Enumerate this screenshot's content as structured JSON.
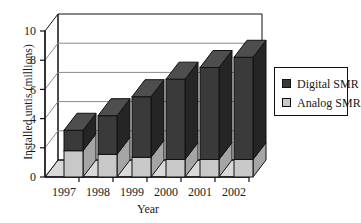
{
  "chart_data": {
    "type": "bar",
    "subtype": "stacked-column-3d",
    "title": "",
    "xlabel": "Year",
    "ylabel": "Installed untis (millions)",
    "categories": [
      "1997",
      "1998",
      "1999",
      "2000",
      "2001",
      "2002"
    ],
    "series": [
      {
        "name": "Analog SMR",
        "color": "#c8c8c8",
        "values": [
          1.8,
          1.55,
          1.35,
          1.2,
          1.2,
          1.2
        ]
      },
      {
        "name": "Digital SMR",
        "color": "#3a3a3a",
        "values": [
          1.4,
          2.65,
          4.15,
          5.5,
          6.3,
          7.0
        ]
      }
    ],
    "totals": [
      3.2,
      4.2,
      5.5,
      6.7,
      7.5,
      8.2
    ],
    "ylim": [
      0,
      10
    ],
    "yticks": [
      0,
      2,
      4,
      6,
      8,
      10
    ],
    "ytick_labels": [
      "0",
      "2",
      "4",
      "6",
      "8",
      "10"
    ],
    "grid": true,
    "grid_axis": "y",
    "legend_position": "right",
    "legend_entries": [
      "Digital SMR",
      "Analog SMR"
    ]
  },
  "axes": {
    "y_title": "Installed untis (millions)",
    "x_title": "Year"
  },
  "colors": {
    "digital": "#3a3a3a",
    "digital_side": "#252525",
    "digital_top": "#4e4e4e",
    "analog": "#c8c8c8",
    "analog_side": "#a5a5a5",
    "analog_top": "#d8d8d8",
    "floor": "#d0d0d0",
    "wall": "#ffffff",
    "grid": "#8a8a8a",
    "axis": "#111111"
  }
}
